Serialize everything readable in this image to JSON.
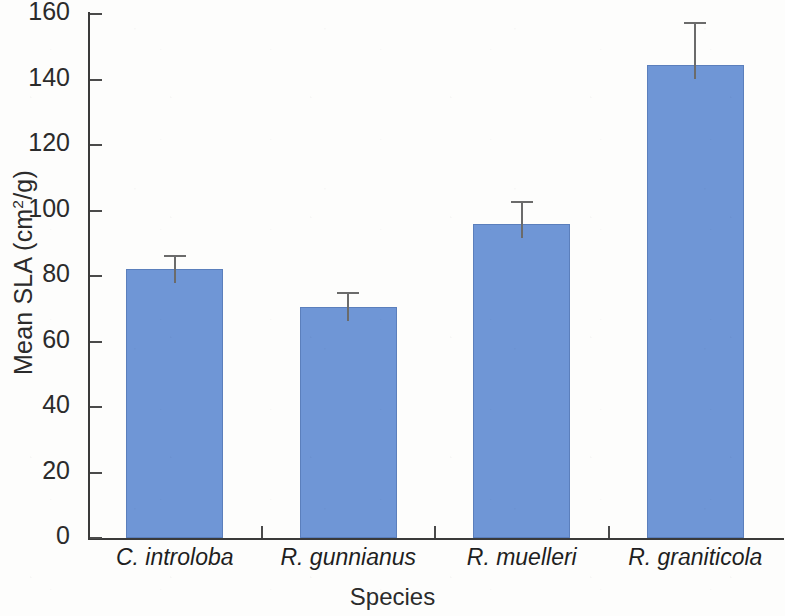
{
  "chart_data": {
    "type": "bar",
    "title": "",
    "xlabel": "Species",
    "ylabel": "Mean SLA (cm2/g)",
    "ylabel_parts": {
      "prefix": "Mean SLA (cm",
      "superscript": "2",
      "suffix": "/g)"
    },
    "categories": [
      "C. introloba",
      "R. gunnianus",
      "R. muelleri",
      "R. graniticola"
    ],
    "values": [
      82,
      70.5,
      96,
      144.5
    ],
    "errors": [
      4.5,
      4.5,
      7,
      13
    ],
    "error_type": "standard error",
    "series": [
      {
        "name": "Mean SLA",
        "values": [
          82,
          70.5,
          96,
          144.5
        ],
        "errors": [
          4.5,
          4.5,
          7,
          13
        ]
      }
    ],
    "ylim": [
      0,
      160
    ],
    "ytick_values": [
      0,
      20,
      40,
      60,
      80,
      100,
      120,
      140,
      160
    ],
    "ytick_labels": [
      "0",
      "20",
      "40",
      "60",
      "80",
      "100",
      "120",
      "140",
      "160"
    ],
    "ytick_step": 20,
    "grid": false,
    "legend": false,
    "legend_position": "none",
    "bar_color": "#6f96d6",
    "bar_border_color": "#5b7fbc",
    "error_bar_color": "#6b6b6b",
    "axis_color": "#3a3a3a",
    "text_color": "#2b2b2b",
    "background_color": "#fdfdfc",
    "category_label_style": "italic"
  }
}
